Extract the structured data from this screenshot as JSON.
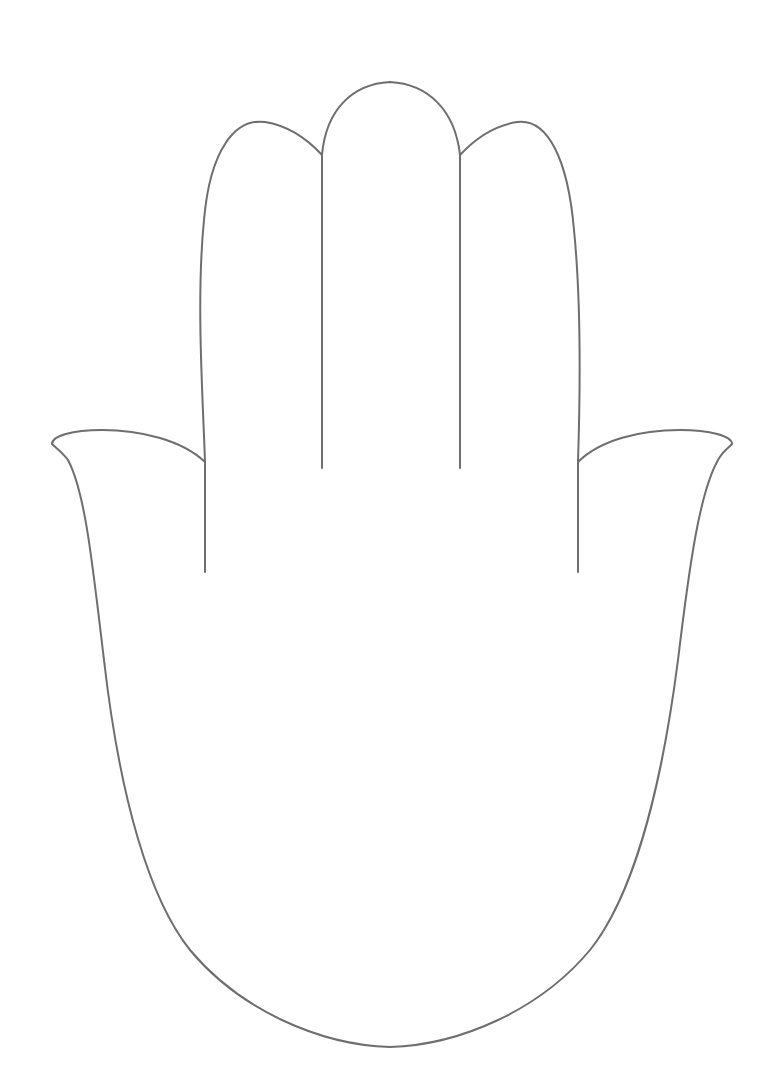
{
  "image": {
    "subject": "hamsa hand outline",
    "stroke_color": "#6e6e6e",
    "background": "#ffffff"
  }
}
